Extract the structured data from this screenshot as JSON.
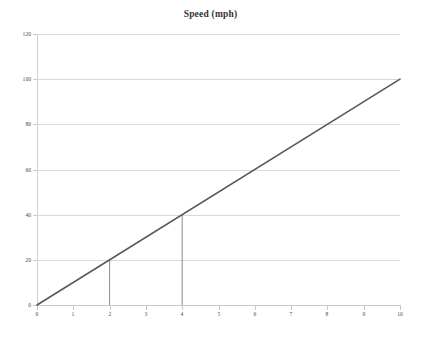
{
  "chart_data": {
    "type": "line",
    "title": "Speed (mph)",
    "xlabel": "",
    "ylabel": "",
    "xlim": [
      0,
      10
    ],
    "ylim": [
      0,
      120
    ],
    "grid": true,
    "legend": false,
    "x_ticks": [
      "0",
      "1",
      "2",
      "3",
      "4",
      "5",
      "6",
      "7",
      "8",
      "9",
      "10"
    ],
    "x_tick_values": [
      0,
      1,
      2,
      3,
      4,
      5,
      6,
      7,
      8,
      9,
      10
    ],
    "y_ticks": [
      "0",
      "20",
      "40",
      "60",
      "80",
      "100",
      "120"
    ],
    "y_tick_values": [
      0,
      20,
      40,
      60,
      80,
      100,
      120
    ],
    "series": [
      {
        "name": "Speed",
        "color": "#595959",
        "x": [
          0,
          10
        ],
        "values": [
          0,
          100
        ]
      }
    ],
    "annotations": [
      {
        "type": "drop-line",
        "label": "drop-line-x2",
        "x": 2,
        "y": 20,
        "color": "#7f7f7f"
      },
      {
        "type": "drop-line",
        "label": "drop-line-x4",
        "x": 4,
        "y": 40,
        "color": "#7f7f7f"
      }
    ],
    "colors": {
      "series": "#595959",
      "gridline": "#d9d9d9",
      "axis": "#c9c9c9",
      "dropline": "#7f7f7f",
      "text": "#4a4a4a",
      "background": "#ffffff"
    }
  }
}
